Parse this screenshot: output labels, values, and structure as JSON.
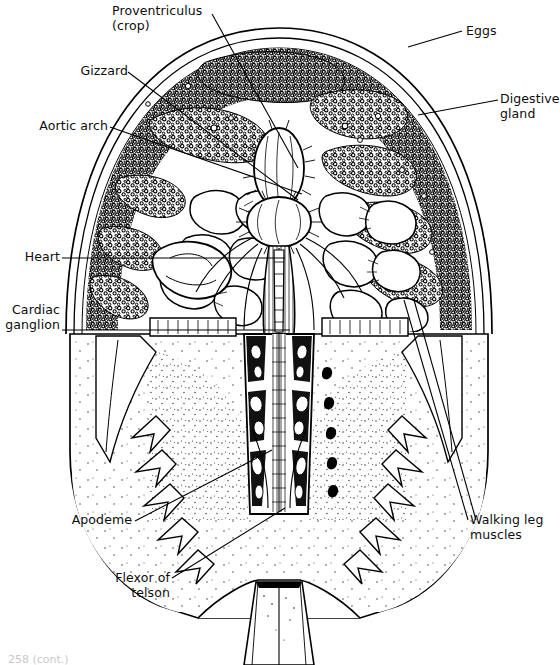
{
  "figure": {
    "style": "black and white scientific line drawing, stipple and hatch shading",
    "background_color": "#ffffff",
    "ink_color": "#000000"
  },
  "labels": [
    {
      "id": "proventriculus",
      "text": "Proventriculus\n(crop)",
      "align": "left",
      "x": 112,
      "y": 4,
      "leader": [
        [
          212,
          14
        ],
        [
          298,
          168
        ]
      ]
    },
    {
      "id": "eggs",
      "text": "Eggs",
      "align": "left",
      "x": 466,
      "y": 24,
      "leader": [
        [
          462,
          31
        ],
        [
          408,
          47
        ]
      ]
    },
    {
      "id": "gizzard",
      "text": "Gizzard",
      "align": "right",
      "x": 20,
      "y": 64,
      "leader": [
        [
          128,
          72
        ],
        [
          298,
          200
        ]
      ]
    },
    {
      "id": "digestive_gland",
      "text": "Digestive\ngland",
      "align": "left",
      "x": 500,
      "y": 92,
      "leader": [
        [
          498,
          100
        ],
        [
          418,
          115
        ]
      ]
    },
    {
      "id": "aortic_arch",
      "text": "Aortic arch",
      "align": "right",
      "x": 20,
      "y": 119,
      "leader": [
        [
          110,
          127
        ],
        [
          302,
          194
        ]
      ]
    },
    {
      "id": "heart",
      "text": "Heart",
      "align": "right",
      "x": 8,
      "y": 250,
      "leader": [
        [
          62,
          258
        ],
        [
          285,
          258
        ]
      ]
    },
    {
      "id": "cardiac_ganglion",
      "text": "Cardiac\nganglion",
      "align": "right",
      "x": 0,
      "y": 303,
      "leader": [
        [
          62,
          330
        ],
        [
          290,
          330
        ]
      ]
    },
    {
      "id": "apodeme",
      "text": "Apodeme",
      "align": "right",
      "x": 65,
      "y": 513,
      "leader": [
        [
          135,
          521
        ],
        [
          272,
          450
        ]
      ]
    },
    {
      "id": "flexor_of_telson",
      "text": "Flexor of\ntelson",
      "align": "right",
      "x": 106,
      "y": 571,
      "leader": [
        [
          172,
          578
        ],
        [
          285,
          508
        ]
      ]
    },
    {
      "id": "walking_leg_muscles",
      "text": "Walking leg\nmuscles",
      "align": "left",
      "x": 470,
      "y": 513,
      "leader": [
        [
          468,
          520
        ],
        [
          404,
          300
        ]
      ]
    }
  ],
  "caption": "258 (cont.)"
}
